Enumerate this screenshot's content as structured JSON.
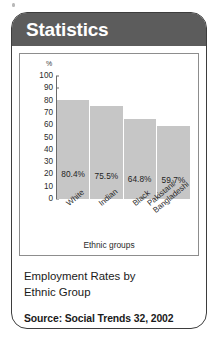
{
  "card": {
    "header_title": "Statistics",
    "header_color": "#5c5c5c",
    "border_color": "#3d3d3d",
    "bar_color": "#c6c6c6"
  },
  "caption": {
    "title_line1": "Employment Rates by",
    "title_line2": "Ethnic Group",
    "source": "Source: Social Trends 32, 2002"
  },
  "chart_data": {
    "type": "bar",
    "title": "Employment Rates by Ethnic Group",
    "categories": [
      "White",
      "Indian",
      "Black",
      "Pakistani/\nBangladeshi"
    ],
    "category_labels": [
      "White",
      "Indian",
      "Black",
      "Pakistani/ Bangladeshi"
    ],
    "values": [
      80.4,
      75.5,
      64.8,
      59.7
    ],
    "value_labels": [
      "80.4%",
      "75.5%",
      "64.8%",
      "59.7%"
    ],
    "xlabel": "Ethnic groups",
    "ylabel": "%",
    "ylim": [
      0,
      100
    ],
    "yticks": [
      100,
      90,
      80,
      70,
      60,
      50,
      40,
      30,
      20,
      10,
      0
    ],
    "ytick_labels": [
      "100",
      "90",
      "80",
      "70",
      "60",
      "50",
      "40",
      "30",
      "20",
      "10",
      "0"
    ],
    "grid": false,
    "legend": false,
    "bar_color": "#c6c6c6",
    "source": "Source: Social Trends 32, 2002"
  }
}
